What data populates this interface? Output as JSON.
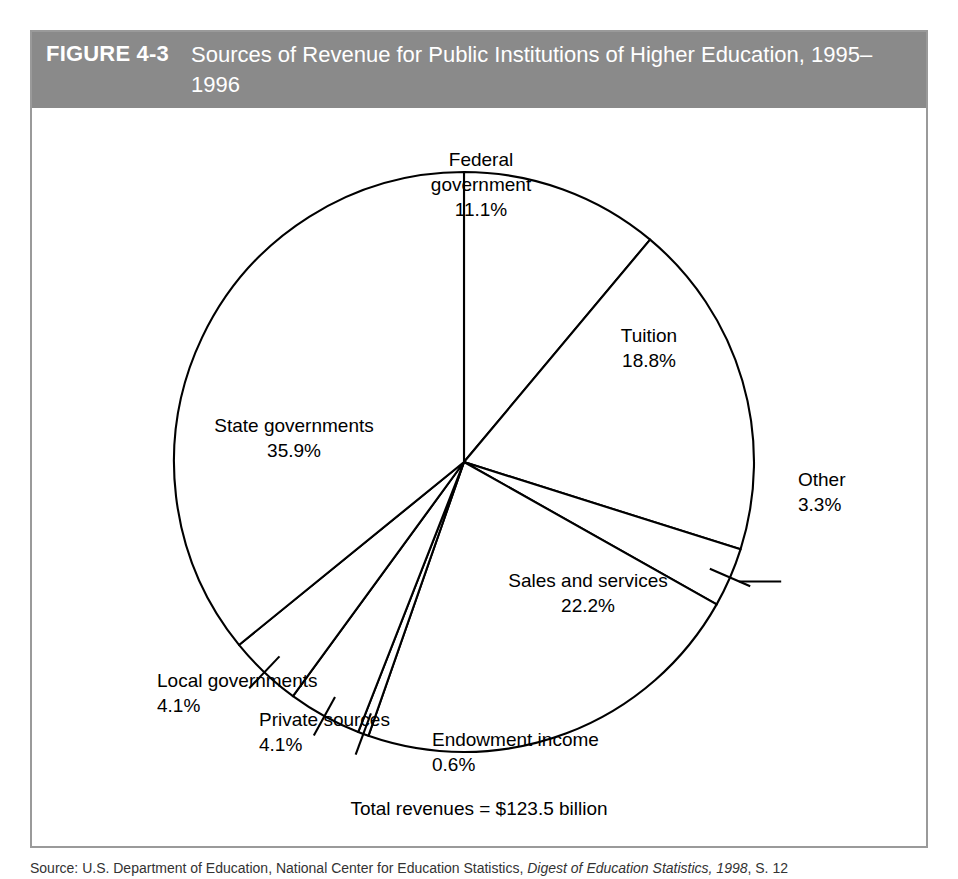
{
  "figure": {
    "number": "FIGURE 4-3",
    "title": "Sources of Revenue for Public Institutions of Higher Education, 1995–1996",
    "header_background": "#8a8a8a",
    "header_text_color": "#ffffff",
    "frame_border_color": "#9a9a9a"
  },
  "total_label": "Total revenues = $123.5 billion",
  "source_note": {
    "label": "Source:",
    "text": " U.S. Department of Education, National Center for Education Statistics, ",
    "italic_title": "Digest of Education Statistics, 1998",
    "tail": ", S. 12"
  },
  "chart_data": {
    "type": "pie",
    "title": "Sources of Revenue for Public Institutions of Higher Education, 1995–1996",
    "unit": "percent",
    "total": "$123.5 billion",
    "legend": "none",
    "start_angle_deg": 0,
    "direction": "clockwise",
    "categories": [
      "Federal government",
      "Tuition",
      "Other",
      "Sales and services",
      "Endowment income",
      "Private sources",
      "Local governments",
      "State governments"
    ],
    "values": [
      11.1,
      18.8,
      3.3,
      22.2,
      0.6,
      4.1,
      4.1,
      35.9
    ],
    "slices": [
      {
        "name": "Federal government",
        "value": 11.1,
        "value_label": "11.1%",
        "label_lines": [
          "Federal",
          "government",
          "11.1%"
        ],
        "label_x": 449,
        "label_y": 58,
        "label_anchor": "middle",
        "fill": "#ffffff",
        "stroke": "#000000",
        "leader": false
      },
      {
        "name": "Tuition",
        "value": 18.8,
        "value_label": "18.8%",
        "label_lines": [
          "Tuition",
          "18.8%"
        ],
        "label_x": 617,
        "label_y": 234,
        "label_anchor": "middle",
        "fill": "#ffffff",
        "stroke": "#000000",
        "leader": false
      },
      {
        "name": "Other",
        "value": 3.3,
        "value_label": "3.3%",
        "label_lines": [
          "Other",
          "3.3%"
        ],
        "label_x": 766,
        "label_y": 378,
        "label_anchor": "start",
        "fill": "#ffffff",
        "stroke": "#000000",
        "leader": true
      },
      {
        "name": "Sales and services",
        "value": 22.2,
        "value_label": "22.2%",
        "label_lines": [
          "Sales and services",
          "22.2%"
        ],
        "label_x": 556,
        "label_y": 479,
        "label_anchor": "middle",
        "fill": "#ffffff",
        "stroke": "#000000",
        "leader": false
      },
      {
        "name": "Endowment income",
        "value": 0.6,
        "value_label": "0.6%",
        "label_lines": [
          "Endowment income",
          "0.6%"
        ],
        "label_x": 400,
        "label_y": 638,
        "label_anchor": "start",
        "fill": "#ffffff",
        "stroke": "#000000",
        "leader": true
      },
      {
        "name": "Private sources",
        "value": 4.1,
        "value_label": "4.1%",
        "label_lines": [
          "Private sources",
          "4.1%"
        ],
        "label_x": 227,
        "label_y": 618,
        "label_anchor": "start",
        "fill": "#ffffff",
        "stroke": "#000000",
        "leader": true
      },
      {
        "name": "Local governments",
        "value": 4.1,
        "value_label": "4.1%",
        "label_lines": [
          "Local governments",
          "4.1%"
        ],
        "label_x": 125,
        "label_y": 579,
        "label_anchor": "start",
        "fill": "#ffffff",
        "stroke": "#000000",
        "leader": true
      },
      {
        "name": "State governments",
        "value": 35.9,
        "value_label": "35.9%",
        "label_lines": [
          "State governments",
          "35.9%"
        ],
        "label_x": 262,
        "label_y": 324,
        "label_anchor": "middle",
        "fill": "#ffffff",
        "stroke": "#000000",
        "leader": false
      }
    ]
  }
}
